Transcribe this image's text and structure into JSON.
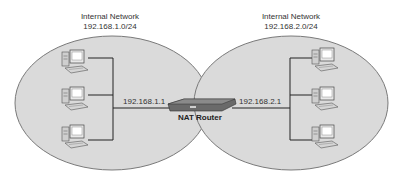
{
  "networks": [
    {
      "name": "Internal Network",
      "subnet": "192.168.1.0/24",
      "gateway_ip": "192.168.1.1",
      "hosts": 3
    },
    {
      "name": "Internal Network",
      "subnet": "192.168.2.0/24",
      "gateway_ip": "192.168.2.1",
      "hosts": 3
    }
  ],
  "router": {
    "label": "NAT Router"
  },
  "colors": {
    "ellipse_fill": "#d9d9d9",
    "ellipse_stroke": "#777777",
    "line": "#222222",
    "router": "#555555"
  }
}
